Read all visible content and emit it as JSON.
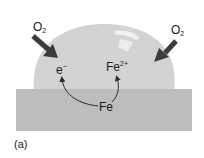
{
  "figure": {
    "panel_label": "(a)",
    "labels": {
      "oxygen_left": {
        "base": "O",
        "sub": "2"
      },
      "oxygen_right": {
        "base": "O",
        "sub": "2"
      },
      "electron": {
        "base": "e",
        "sup": "−"
      },
      "ferrous_ion": {
        "base": "Fe",
        "sup": "2+"
      },
      "iron": "Fe"
    },
    "colors": {
      "background": "#ffffff",
      "droplet": "#d2d2d2",
      "substrate": "#bdbdbd",
      "arrow": "#3a3a3a",
      "text": "#1a1a1a"
    },
    "elements": [
      "water droplet on iron substrate",
      "O2 arrows diffusing into droplet from left and right",
      "curved arrows from Fe to e- and Fe2+"
    ]
  }
}
